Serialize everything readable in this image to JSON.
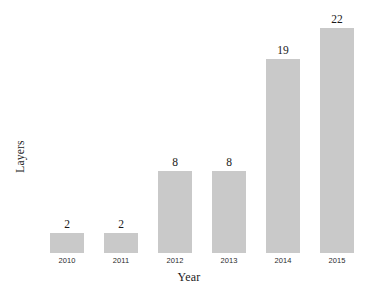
{
  "chart_data": {
    "type": "bar",
    "title": "",
    "subtitle": "",
    "xlabel": "Year",
    "ylabel": "Layers",
    "categories": [
      "2010",
      "2011",
      "2012",
      "2013",
      "2014",
      "2015"
    ],
    "values": [
      2,
      2,
      8,
      8,
      19,
      22
    ],
    "data_labels": [
      "2",
      "2",
      "8",
      "8",
      "19",
      "22"
    ],
    "ylim": [
      0,
      24
    ],
    "grid": false,
    "legend": null,
    "legend_position": "none",
    "axis_lines": false,
    "bar_color": "#c9c9c9",
    "background_color": "#ffffff",
    "text_color": "#1a1a1a"
  }
}
